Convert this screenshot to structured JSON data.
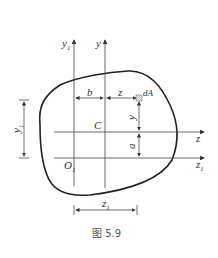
{
  "figure": {
    "caption": "图 5.9",
    "labels": {
      "y1_axis": "y",
      "y1_sub": "1",
      "y_axis": "y",
      "z_axis": "z",
      "z1_axis": "z",
      "z1_sub": "1",
      "origin": "O",
      "origin_sub": "1",
      "centroid": "C",
      "dA": "dA",
      "dim_b": "b",
      "dim_z": "z",
      "dim_y": "y",
      "dim_a": "a",
      "dim_y1": "y",
      "dim_y1_sub": "1",
      "dim_z1": "z",
      "dim_z1_sub": "1"
    }
  }
}
